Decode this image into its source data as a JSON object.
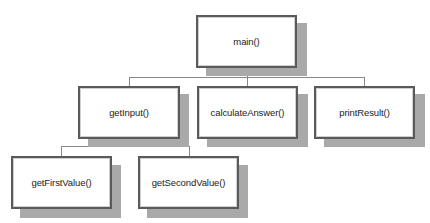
{
  "diagram": {
    "type": "hierarchy-chart",
    "nodes": {
      "main": {
        "label": "main()"
      },
      "getInput": {
        "label": "getInput()"
      },
      "calculateAnswer": {
        "label": "calculateAnswer()"
      },
      "printResult": {
        "label": "printResult()"
      },
      "getFirstValue": {
        "label": "getFirstValue()"
      },
      "getSecondValue": {
        "label": "getSecondValue()"
      }
    },
    "edges": [
      {
        "from": "main()",
        "to": "getInput()"
      },
      {
        "from": "main()",
        "to": "calculateAnswer()"
      },
      {
        "from": "main()",
        "to": "printResult()"
      },
      {
        "from": "getInput()",
        "to": "getFirstValue()"
      },
      {
        "from": "getInput()",
        "to": "getSecondValue()"
      }
    ],
    "colors": {
      "box_border": "#5a5a5a",
      "shadow": "#a9a9a9",
      "connector": "#888888",
      "background": "#ffffff"
    }
  }
}
